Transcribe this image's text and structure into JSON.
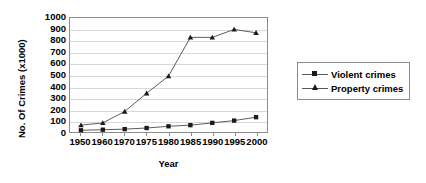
{
  "chart_data": {
    "type": "line",
    "title": "",
    "xlabel": "Year",
    "ylabel": "No. Of Crimes (x1000)",
    "categories": [
      "1950",
      "1960",
      "1970",
      "1975",
      "1980",
      "1985",
      "1990",
      "1995",
      "2000"
    ],
    "x": [
      1950,
      1960,
      1970,
      1975,
      1980,
      1985,
      1990,
      1995,
      2000
    ],
    "series": [
      {
        "name": "Violent crimes",
        "marker": "square",
        "color": "#1a1a1a",
        "values": [
          15,
          20,
          25,
          35,
          50,
          60,
          80,
          100,
          130
        ]
      },
      {
        "name": "Property crimes",
        "marker": "triangle",
        "color": "#1a1a1a",
        "values": [
          60,
          80,
          180,
          340,
          490,
          830,
          830,
          900,
          870
        ]
      }
    ],
    "ylim": [
      0,
      1000
    ],
    "yticks": [
      0,
      100,
      200,
      300,
      400,
      500,
      600,
      700,
      800,
      900,
      1000
    ],
    "ytick_labels": [
      "0",
      "100",
      "200",
      "300",
      "400",
      "500",
      "600",
      "700",
      "800",
      "900",
      "1000"
    ],
    "grid": true,
    "grid_color": "#d9d9d9",
    "legend_position": "right",
    "plot_border_color": "#8d8d8d",
    "line_color": "#595959",
    "background": "#ffffff"
  }
}
